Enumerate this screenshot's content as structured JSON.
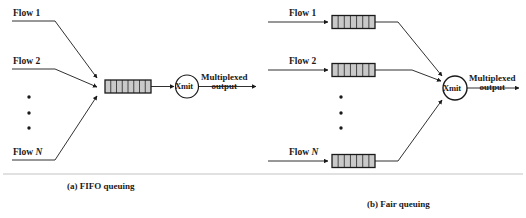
{
  "figure": {
    "colors": {
      "stroke": "#1a1a1a",
      "queue_fill": "#c9c9c9",
      "queue_cell_line": "#1a1a1a",
      "background": "#ffffff",
      "text": "#1a1a1a"
    }
  },
  "panel_a": {
    "caption": "(a) FIFO queuing",
    "flows": [
      {
        "label_prefix": "Flow",
        "label_value": "1"
      },
      {
        "label_prefix": "Flow",
        "label_value": "2"
      },
      {
        "label_prefix": "Flow",
        "label_value": "N"
      }
    ],
    "ellipsis_dots": 3,
    "queue": {
      "cells": 8
    },
    "node_label": "Xmit",
    "output_label_line1": "Multiplexed",
    "output_label_line2": "output"
  },
  "panel_b": {
    "caption": "(b) Fair queuing",
    "flows": [
      {
        "label_prefix": "Flow",
        "label_value": "1",
        "queue_cells": 7
      },
      {
        "label_prefix": "Flow",
        "label_value": "2",
        "queue_cells": 7
      },
      {
        "label_prefix": "Flow",
        "label_value": "N",
        "queue_cells": 7
      }
    ],
    "ellipsis_dots": 3,
    "node_label": "Xmit",
    "output_label_line1": "Multiplexed",
    "output_label_line2": "output"
  }
}
